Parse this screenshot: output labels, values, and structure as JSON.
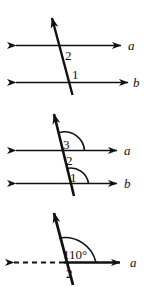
{
  "figure": {
    "background_color": "#ffffff",
    "stroke_color": "#111111",
    "width": 149,
    "height": 287
  },
  "diagrams": [
    {
      "id": "diagram-top",
      "description": "Two parallel horizontal lines a and b cut by a transversal, angles 2 and 1 marked",
      "line_labels": [
        {
          "name": "line-label-a",
          "text": "a"
        },
        {
          "name": "line-label-b",
          "text": "b"
        }
      ],
      "angle_labels": [
        {
          "name": "angle-label-2",
          "text": "2"
        },
        {
          "name": "angle-label-1",
          "text": "1"
        }
      ]
    },
    {
      "id": "diagram-middle",
      "description": "Two parallel horizontal lines a and b cut by a transversal, angles 3, 2 and 1 marked with arcs",
      "line_labels": [
        {
          "name": "line-label-a",
          "text": "a"
        },
        {
          "name": "line-label-b",
          "text": "b"
        }
      ],
      "angle_labels": [
        {
          "name": "angle-label-3",
          "text": "3"
        },
        {
          "name": "angle-label-2",
          "text": "2"
        },
        {
          "name": "angle-label-1",
          "text": "1"
        }
      ]
    },
    {
      "id": "diagram-bottom",
      "description": "Single horizontal line a with dashed left ray cut by a transversal, angle of 110 degrees marked and angle 2 below",
      "line_labels": [
        {
          "name": "line-label-a",
          "text": "a"
        }
      ],
      "angle_labels": [
        {
          "name": "angle-measure-110",
          "text": "110°"
        },
        {
          "name": "angle-label-2",
          "text": "2"
        }
      ]
    }
  ]
}
